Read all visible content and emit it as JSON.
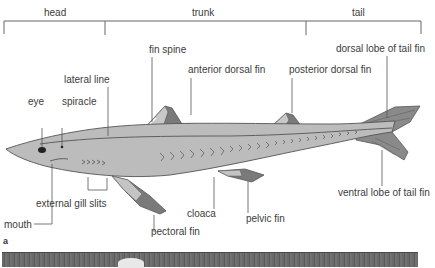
{
  "sections": [
    {
      "label": "head"
    },
    {
      "label": "trunk"
    },
    {
      "label": "tail"
    }
  ],
  "labels": {
    "fin_spine": "fin spine",
    "lateral_line": "lateral line",
    "anterior_dorsal_fin": "anterior dorsal fin",
    "posterior_dorsal_fin": "posterior dorsal fin",
    "dorsal_lobe_tail_fin": "dorsal lobe of tail fin",
    "eye": "eye",
    "spiracle": "spiracle",
    "mouth": "mouth",
    "external_gill_slits": "external gill slits",
    "pectoral_fin": "pectoral fin",
    "cloaca": "cloaca",
    "pelvic_fin": "pelvic fin",
    "ventral_lobe_tail_fin": "ventral lobe of tail fin"
  },
  "panel_letter": "a",
  "colors": {
    "body": "#b9b9b9",
    "fin_dark": "#6e6e6e",
    "outline": "#555555",
    "leader": "#555555"
  }
}
